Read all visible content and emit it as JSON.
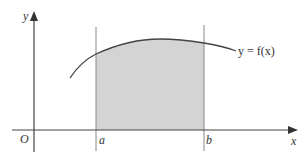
{
  "diagram": {
    "type": "area-under-curve",
    "colors": {
      "axis": "#444444",
      "curve": "#444444",
      "bound_lines": "#888888",
      "shaded_region": "#d4d4d4",
      "text": "#333333"
    },
    "axes": {
      "x_label": "x",
      "y_label": "y",
      "origin_label": "O"
    },
    "bounds": {
      "lower_label": "a",
      "upper_label": "b"
    },
    "curve": {
      "label": "y = f(x)"
    }
  }
}
